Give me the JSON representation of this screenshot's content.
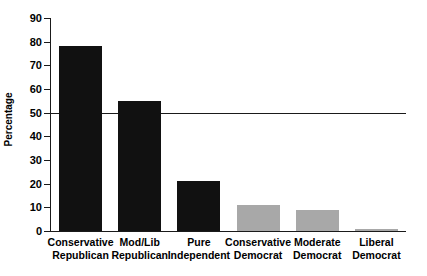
{
  "chart_data": {
    "type": "bar",
    "title": "",
    "xlabel": "",
    "ylabel": "Percentage",
    "categories": [
      "Conservative Republican",
      "Mod/Lib Republican",
      "Pure Independent",
      "Conservative Democrat",
      "Moderate Democrat",
      "Liberal Democrat"
    ],
    "category_lines": [
      [
        "Conservative",
        "Republican"
      ],
      [
        "Mod/Lib",
        "Republican"
      ],
      [
        "Pure",
        "Independent"
      ],
      [
        "Conservative",
        "Democrat"
      ],
      [
        "Moderate",
        "Democrat"
      ],
      [
        "Liberal",
        "Democrat"
      ]
    ],
    "values": [
      78,
      55,
      21,
      11,
      9,
      1
    ],
    "bar_colors": [
      "#111111",
      "#111111",
      "#111111",
      "#a8a8a8",
      "#a8a8a8",
      "#a8a8a8"
    ],
    "ylim": [
      0,
      90
    ],
    "yticks": [
      0,
      10,
      20,
      30,
      40,
      50,
      60,
      70,
      80,
      90
    ],
    "ytick_labels": [
      "0",
      "10",
      "20",
      "30",
      "40",
      "50",
      "60",
      "70",
      "80",
      "90"
    ],
    "grid": false,
    "legend": "none",
    "annotations": [
      {
        "name": "fifty-percent-reference-line",
        "type": "hline",
        "value": 50,
        "color": "#1a1a1a"
      }
    ]
  },
  "colors": {
    "axis": "#1a1a1a",
    "bar_dark": "#111111",
    "bar_light": "#a8a8a8",
    "background": "#ffffff"
  }
}
